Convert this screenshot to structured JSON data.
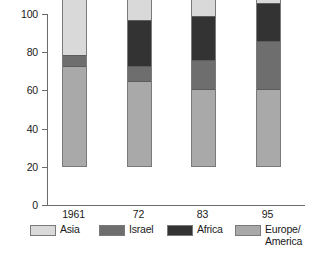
{
  "chart_data": {
    "type": "bar",
    "subtype": "stacked-100-percent",
    "title": "",
    "xlabel": "",
    "ylabel": "",
    "ylim": [
      0,
      100
    ],
    "yticks": [
      0,
      20,
      40,
      60,
      80,
      100
    ],
    "ytick_labels": [
      "0",
      "20",
      "40",
      "60",
      "80",
      "100"
    ],
    "grid": false,
    "legend_position": "bottom",
    "categories": [
      "1961",
      "72",
      "83",
      "95"
    ],
    "series": [
      {
        "name": "Europe/America",
        "color": "#a9a9a9",
        "values": [
          52,
          44,
          40,
          40
        ]
      },
      {
        "name": "Israel",
        "color": "#6e6e6e",
        "values": [
          5.5,
          8,
          15,
          25
        ]
      },
      {
        "name": "Africa",
        "color": "#333333",
        "values": [
          0,
          24,
          23,
          20
        ]
      },
      {
        "name": "Asia",
        "color": "#d9d9d9",
        "values": [
          42.5,
          24,
          22,
          15
        ]
      }
    ],
    "legend_order": [
      "Asia",
      "Israel",
      "Africa",
      "Europe/America"
    ],
    "legend": [
      {
        "label": "Asia",
        "color": "#d9d9d9"
      },
      {
        "label": "Israel",
        "color": "#6e6e6e"
      },
      {
        "label": "Africa",
        "color": "#333333"
      },
      {
        "label": "Europe/\nAmerica",
        "color": "#a9a9a9"
      }
    ],
    "axis_color": "#6b6b6b",
    "bar_border_color": "#7a7a7a"
  }
}
